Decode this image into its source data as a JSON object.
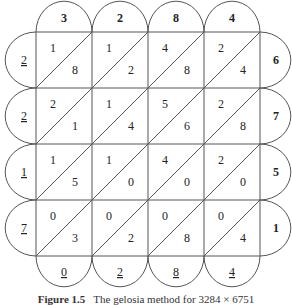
{
  "diagram": {
    "type": "lattice-multiplication",
    "top_factor_digits": [
      "3",
      "2",
      "8",
      "4"
    ],
    "right_factor_digits": [
      "6",
      "7",
      "5",
      "1"
    ],
    "left_carry_digits": [
      "2",
      "2",
      "1",
      "7"
    ],
    "bottom_result_digits": [
      "0",
      "2",
      "8",
      "4"
    ],
    "cells": [
      [
        {
          "tens": "1",
          "ones": "8"
        },
        {
          "tens": "1",
          "ones": "2"
        },
        {
          "tens": "4",
          "ones": "8"
        },
        {
          "tens": "2",
          "ones": "4"
        }
      ],
      [
        {
          "tens": "2",
          "ones": "1"
        },
        {
          "tens": "1",
          "ones": "4"
        },
        {
          "tens": "5",
          "ones": "6"
        },
        {
          "tens": "2",
          "ones": "8"
        }
      ],
      [
        {
          "tens": "1",
          "ones": "5"
        },
        {
          "tens": "1",
          "ones": "0"
        },
        {
          "tens": "4",
          "ones": "0"
        },
        {
          "tens": "2",
          "ones": "0"
        }
      ],
      [
        {
          "tens": "0",
          "ones": "3"
        },
        {
          "tens": "0",
          "ones": "2"
        },
        {
          "tens": "0",
          "ones": "8"
        },
        {
          "tens": "0",
          "ones": "4"
        }
      ]
    ],
    "result": "22170284"
  },
  "caption": {
    "label": "Figure 1.5",
    "text": "The gelosia method for 3284 × 6751"
  }
}
